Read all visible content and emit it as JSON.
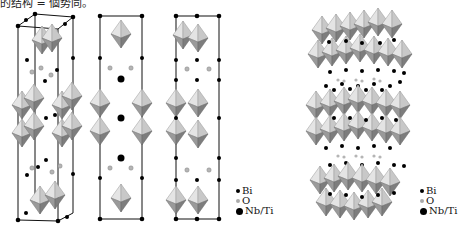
{
  "caption_fragment": "的结构 = 個势同。",
  "figure": {
    "left_panel": {
      "description": "Three unit-cell projections of a layered perovskite (octahedra with Bi, O, Nb/Ti atoms)",
      "legend": [
        {
          "symbol": "small-black-dot",
          "label": "Bi"
        },
        {
          "symbol": "small-gray-dot",
          "label": "O"
        },
        {
          "symbol": "large-black-dot",
          "label": "Nb/Ti"
        }
      ]
    },
    "right_panel": {
      "description": "3D polyhedral view of layered stacking",
      "legend": [
        {
          "symbol": "small-black-dot",
          "label": "Bi"
        },
        {
          "symbol": "small-gray-dot",
          "label": "O"
        },
        {
          "symbol": "large-black-dot",
          "label": "Nb/Ti"
        }
      ]
    }
  },
  "colors": {
    "octa_light": "#d9d9d9",
    "octa_dark": "#8a8a8a",
    "atom": "#000000",
    "oxygen": "#b0b0b0"
  }
}
